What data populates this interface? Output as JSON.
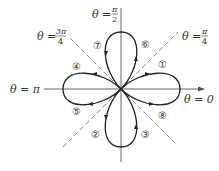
{
  "diagram": {
    "type": "polar-rose-curve",
    "curve": "four-petal rose",
    "colors": {
      "curve": "#222222",
      "axes": "#555555",
      "dashed": "#777777",
      "text": "#333333"
    },
    "axis_labels": {
      "theta_zero": {
        "lhs": "θ",
        "eq": " = ",
        "value": "0"
      },
      "theta_pi": {
        "lhs": "θ",
        "eq": " = ",
        "value": "π"
      },
      "theta_pi_2": {
        "lhs": "θ",
        "eq": " = ",
        "num": "π",
        "den": "2"
      },
      "theta_pi_4": {
        "lhs": "θ",
        "eq": " = ",
        "num": "π",
        "den": "4"
      },
      "theta_3pi_4": {
        "lhs": "θ",
        "eq": " = ",
        "num": "3π",
        "den": "4"
      }
    },
    "segment_labels": [
      "①",
      "②",
      "③",
      "④",
      "⑤",
      "⑥",
      "⑦",
      "⑧"
    ]
  }
}
